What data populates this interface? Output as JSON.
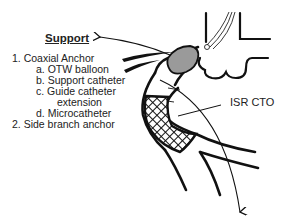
{
  "title": "Support",
  "list": {
    "item1": "1. Coaxial Anchor",
    "item1a": "a. OTW balloon",
    "item1b": "b. Support catheter",
    "item1c_line1": "c. Guide catheter",
    "item1c_line2": "extension",
    "item1d": "d. Microcatheter",
    "item2": "2. Side branch anchor"
  },
  "annotations": {
    "lesion": "ISR CTO"
  },
  "colors": {
    "line": "#111111",
    "balloon_fill": "#9a9a9a",
    "background": "#ffffff"
  }
}
